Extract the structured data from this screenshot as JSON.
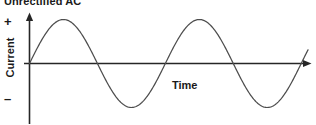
{
  "figure": {
    "title": "Unrectified AC",
    "y_axis_label": "Current",
    "x_axis_label": "Time",
    "positive_symbol": "+",
    "negative_symbol": "–",
    "background_color": "#ffffff",
    "axis_color": "#262626",
    "curve_color": "#4d4d4d",
    "text_color": "#1a1a1a"
  },
  "chart_data": {
    "type": "line",
    "title": "Unrectified AC",
    "xlabel": "Time",
    "ylabel": "Current",
    "grid": false,
    "legend": null,
    "annotations": [
      "+",
      "–"
    ],
    "axis_style": {
      "x_axis_arrow": true,
      "y_axis_arrow": true,
      "x_axis_y_value": 0,
      "tick_labels": false
    },
    "xlim": [
      0,
      2.05
    ],
    "ylim": [
      -1.15,
      1.15
    ],
    "series": [
      {
        "name": "AC current",
        "waveform": "sine",
        "cycles": 2.05,
        "amplitude": 1.0,
        "x": [
          0,
          0.0625,
          0.125,
          0.1875,
          0.25,
          0.3125,
          0.375,
          0.4375,
          0.5,
          0.5625,
          0.625,
          0.6875,
          0.75,
          0.8125,
          0.875,
          0.9375,
          1.0,
          1.0625,
          1.125,
          1.1875,
          1.25,
          1.3125,
          1.375,
          1.4375,
          1.5,
          1.5625,
          1.625,
          1.6875,
          1.75,
          1.8125,
          1.875,
          1.9375,
          2.0,
          2.05
        ],
        "values": [
          0,
          0.383,
          0.707,
          0.924,
          1.0,
          0.924,
          0.707,
          0.383,
          0,
          -0.383,
          -0.707,
          -0.924,
          -1.0,
          -0.924,
          -0.707,
          -0.383,
          0,
          0.383,
          0.707,
          0.924,
          1.0,
          0.924,
          0.707,
          0.383,
          0,
          -0.383,
          -0.707,
          -0.924,
          -1.0,
          -0.924,
          -0.707,
          -0.383,
          0,
          0.309
        ]
      }
    ]
  }
}
